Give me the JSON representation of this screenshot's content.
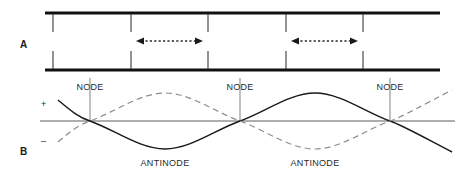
{
  "figure": {
    "width": 476,
    "height": 179,
    "background": "#ffffff",
    "panels": [
      {
        "letter": "A",
        "description": "tube-with-particle-motion-arrows"
      },
      {
        "letter": "B",
        "description": "standing-wave-displacement-curves"
      }
    ]
  },
  "panel_a": {
    "letter": "A",
    "tube": {
      "left": 45,
      "right": 440,
      "top_wall_y": 13,
      "bottom_wall_y": 70,
      "wall_color": "#111111"
    },
    "tick_color": "#3a3a3a",
    "ticks_x": [
      53,
      131,
      208,
      286,
      363
    ],
    "arrows": [
      {
        "name": "particle-motion-arrow-left",
        "x_start": 137,
        "x_end": 202,
        "y": 41,
        "style": "dotted-double-headed"
      },
      {
        "name": "particle-motion-arrow-right",
        "x_start": 292,
        "x_end": 357,
        "y": 41,
        "style": "dotted-double-headed"
      }
    ]
  },
  "panel_b": {
    "letter": "B",
    "axis": {
      "y": 121,
      "left": 40,
      "right": 455,
      "color": "#5e5e5e"
    },
    "sign_positive": "+",
    "sign_negative": "–",
    "sign_positive_pos": {
      "x": 44,
      "y": 104
    },
    "sign_negative_pos": {
      "x": 44,
      "y": 141
    },
    "wave_amplitude": 28,
    "wave_left": 58,
    "wave_right": 452,
    "solid_curve_color": "#1a1a1a",
    "dashed_curve_color": "#8d8d8d",
    "node_guides_x": [
      90,
      240,
      390
    ],
    "node_guide_top": 78,
    "node_guide_color": "#8d8d8d",
    "node_labels": [
      {
        "text": "NODE",
        "x": 90,
        "y": 90
      },
      {
        "text": "NODE",
        "x": 240,
        "y": 90
      },
      {
        "text": "NODE",
        "x": 390,
        "y": 90
      }
    ],
    "antinode_labels": [
      {
        "text": "ANTINODE",
        "x": 165,
        "y": 166
      },
      {
        "text": "ANTINODE",
        "x": 315,
        "y": 166
      }
    ]
  },
  "colors": {
    "ink": "#1a1a1a",
    "wall": "#111111",
    "gray": "#8d8d8d",
    "axis": "#5e5e5e",
    "paper": "#ffffff"
  }
}
